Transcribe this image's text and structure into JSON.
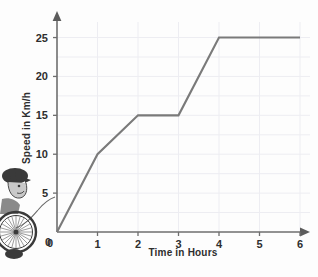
{
  "chart_data": {
    "type": "line",
    "title": "",
    "xlabel": "Time in Hours",
    "ylabel": "Speed in Km/h",
    "xlim": [
      0,
      6
    ],
    "ylim": [
      0,
      27
    ],
    "xticks": [
      0,
      1,
      2,
      3,
      4,
      5,
      6
    ],
    "yticks": [
      0,
      5,
      10,
      15,
      20,
      25
    ],
    "xtick_labels": [
      "0",
      "1",
      "2",
      "3",
      "4",
      "5",
      "6"
    ],
    "ytick_labels": [
      "0",
      "5",
      "10",
      "15",
      "20",
      "25"
    ],
    "grid": true,
    "legend": false,
    "series": [
      {
        "name": "speed",
        "x": [
          0,
          1,
          2,
          3,
          4,
          6
        ],
        "y": [
          0,
          10,
          15,
          15,
          25,
          25
        ],
        "color": "#7a7a7a"
      }
    ],
    "annotations": [
      {
        "name": "cyclist-illustration",
        "description": "Cyclist with helmet on a bicycle wheel, pointer curve to origin"
      }
    ]
  },
  "axes": {
    "x_axis_name": "Time in Hours",
    "y_axis_name": "Speed in Km/h",
    "x_arrow": "arrow-right",
    "y_arrow": "arrow-up"
  },
  "colors": {
    "line": "#7a7a7a",
    "axis": "#6e6e6e",
    "grid": "#ededf2",
    "text": "#2e2e2e",
    "background": "#fdfdfd"
  }
}
